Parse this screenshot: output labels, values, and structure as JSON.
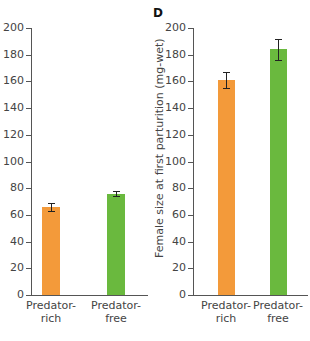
{
  "chart_data": [
    {
      "type": "bar",
      "panel": "",
      "title": "",
      "xlabel": "",
      "ylabel": "",
      "categories": [
        "Predator-rich",
        "Predator-free"
      ],
      "category_lines": [
        [
          "Predator-",
          "rich"
        ],
        [
          "Predator-",
          "free"
        ]
      ],
      "values": [
        66,
        76
      ],
      "errors": [
        3,
        2
      ],
      "colors": [
        "#f39a3a",
        "#6ab93e"
      ],
      "ylim": [
        0,
        200
      ],
      "yticks": [
        0,
        20,
        40,
        60,
        80,
        100,
        120,
        140,
        160,
        180,
        200
      ],
      "grid": false
    },
    {
      "type": "bar",
      "panel": "D",
      "title": "",
      "xlabel": "",
      "ylabel": "Female size at first parturition (mg-wet)",
      "categories": [
        "Predator-rich",
        "Predator-free"
      ],
      "category_lines": [
        [
          "Predator-",
          "rich"
        ],
        [
          "Predator-",
          "free"
        ]
      ],
      "values": [
        161,
        184
      ],
      "errors": [
        6,
        8
      ],
      "colors": [
        "#f39a3a",
        "#6ab93e"
      ],
      "ylim": [
        0,
        200
      ],
      "yticks": [
        0,
        20,
        40,
        60,
        80,
        100,
        120,
        140,
        160,
        180,
        200
      ],
      "grid": false
    }
  ],
  "panels": {
    "right_letter": "D",
    "right_ylabel": "Female size at first parturition (mg-wet)"
  }
}
